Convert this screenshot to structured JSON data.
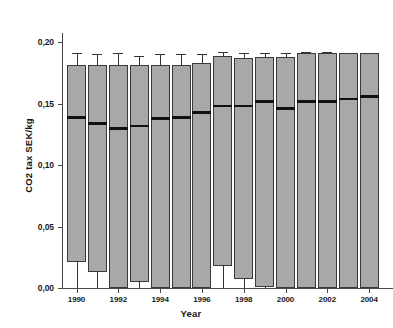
{
  "chart_data": {
    "type": "box",
    "title": "",
    "xlabel": "Year",
    "ylabel": "CO2 tax SEK/kg",
    "ylim": [
      0.0,
      0.215
    ],
    "ytick_values": [
      0.0,
      0.05,
      0.1,
      0.15,
      0.2
    ],
    "ytick_labels": [
      "0,00",
      "0,05",
      "0,10",
      "0,15",
      "0,20"
    ],
    "xtick_labels": [
      "1990",
      "1992",
      "1994",
      "1996",
      "1998",
      "2000",
      "2002",
      "2004"
    ],
    "categories": [
      "1990",
      "1991",
      "1992",
      "1993",
      "1994",
      "1995",
      "1996",
      "1997",
      "1998",
      "1999",
      "2000",
      "2001",
      "2002",
      "2003",
      "2004"
    ],
    "grid": false,
    "legend": "none",
    "box_fill_color": "#a8a8a8",
    "box_edge_color": "#3a3a3a",
    "median_color": "#111111",
    "whisker_color": "#333333",
    "boxes": [
      {
        "year": "1990",
        "whisker_low": 0.0,
        "q1": 0.021,
        "median": 0.139,
        "q3": 0.181,
        "whisker_high": 0.191
      },
      {
        "year": "1991",
        "whisker_low": 0.0,
        "q1": 0.013,
        "median": 0.134,
        "q3": 0.181,
        "whisker_high": 0.19
      },
      {
        "year": "1992",
        "whisker_low": 0.0,
        "q1": 0.0,
        "median": 0.13,
        "q3": 0.181,
        "whisker_high": 0.191
      },
      {
        "year": "1993",
        "whisker_low": 0.0,
        "q1": 0.005,
        "median": 0.132,
        "q3": 0.181,
        "whisker_high": 0.189
      },
      {
        "year": "1994",
        "whisker_low": 0.0,
        "q1": 0.0,
        "median": 0.138,
        "q3": 0.181,
        "whisker_high": 0.19
      },
      {
        "year": "1995",
        "whisker_low": 0.0,
        "q1": 0.0,
        "median": 0.139,
        "q3": 0.181,
        "whisker_high": 0.19
      },
      {
        "year": "1996",
        "whisker_low": 0.0,
        "q1": 0.0,
        "median": 0.143,
        "q3": 0.183,
        "whisker_high": 0.19
      },
      {
        "year": "1997",
        "whisker_low": 0.0,
        "q1": 0.018,
        "median": 0.148,
        "q3": 0.189,
        "whisker_high": 0.192
      },
      {
        "year": "1998",
        "whisker_low": 0.0,
        "q1": 0.007,
        "median": 0.148,
        "q3": 0.187,
        "whisker_high": 0.191
      },
      {
        "year": "1999",
        "whisker_low": 0.0,
        "q1": 0.001,
        "median": 0.152,
        "q3": 0.188,
        "whisker_high": 0.191
      },
      {
        "year": "2000",
        "whisker_low": 0.0,
        "q1": 0.0,
        "median": 0.146,
        "q3": 0.188,
        "whisker_high": 0.191
      },
      {
        "year": "2001",
        "whisker_low": 0.0,
        "q1": 0.0,
        "median": 0.152,
        "q3": 0.191,
        "whisker_high": 0.192
      },
      {
        "year": "2002",
        "whisker_low": 0.0,
        "q1": 0.0,
        "median": 0.152,
        "q3": 0.191,
        "whisker_high": 0.192
      },
      {
        "year": "2003",
        "whisker_low": 0.0,
        "q1": 0.0,
        "median": 0.154,
        "q3": 0.191,
        "whisker_high": 0.191
      },
      {
        "year": "2004",
        "whisker_low": 0.0,
        "q1": 0.0,
        "median": 0.156,
        "q3": 0.191,
        "whisker_high": 0.191
      }
    ]
  }
}
